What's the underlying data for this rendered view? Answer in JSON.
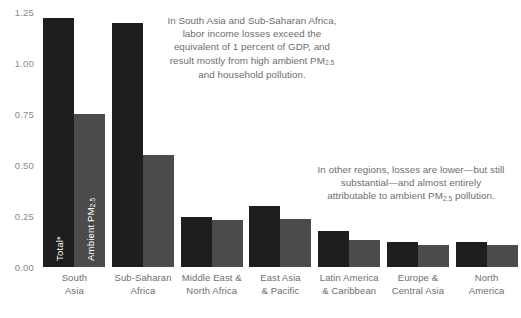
{
  "chart_data": {
    "type": "bar",
    "title": "",
    "subtitle": "",
    "xlabel": "",
    "ylabel": "",
    "ylim": [
      0.0,
      1.25
    ],
    "yticks": [
      "0.00",
      "0.25",
      "0.50",
      "0.75",
      "1.00",
      "1.25"
    ],
    "ytick_values": [
      0.0,
      0.25,
      0.5,
      0.75,
      1.0,
      1.25
    ],
    "grid": false,
    "legend_position": "in-bar",
    "categories": [
      "South Asia",
      "Sub-Saharan Africa",
      "Middle East & North Africa",
      "East Asia & Pacific",
      "Latin America & Caribbean",
      "Europe & Central Asia",
      "North America"
    ],
    "category_lines": [
      [
        "South",
        "Asia"
      ],
      [
        "Sub-Saharan",
        "Africa"
      ],
      [
        "Middle East &",
        "North Africa"
      ],
      [
        "East Asia",
        "& Pacific"
      ],
      [
        "Latin America",
        "& Caribbean"
      ],
      [
        "Europe &",
        "Central Asia"
      ],
      [
        "North",
        "America"
      ]
    ],
    "series": [
      {
        "name": "Total*",
        "label_html": "Total*",
        "color": "#1e1e1e",
        "values": [
          1.22,
          1.195,
          0.245,
          0.3,
          0.175,
          0.125,
          0.125
        ]
      },
      {
        "name": "Ambient PM2.5",
        "label_html": "Ambient PM<sub>2.5</sub>",
        "color": "#4b4b4b",
        "values": [
          0.75,
          0.55,
          0.23,
          0.235,
          0.13,
          0.11,
          0.11
        ]
      }
    ],
    "annotations": [
      {
        "id": "annotation-1",
        "html": "In South Asia and Sub-Saharan Africa, labor income losses exceed the equivalent of 1 percent of GDP, and result mostly from high ambient PM<sub>2.5</sub> and household pollution.",
        "text": "In South Asia and Sub-Saharan Africa, labor income losses exceed the equivalent of 1 percent of GDP, and result mostly from high ambient PM2.5 and household pollution."
      },
      {
        "id": "annotation-2",
        "html": "In other regions, losses are lower—but still substantial—and almost entirely attributable to ambient PM<sub>2.5</sub> pollution.",
        "text": "In other regions, losses are lower—but still substantial—and almost entirely attributable to ambient PM2.5 pollution."
      }
    ],
    "colors": {
      "total_bar": "#1e1e1e",
      "ambient_bar": "#4b4b4b",
      "axis_text": "#8a8a8a",
      "category_text": "#6e6e6e",
      "annotation_text": "#6e6e6e",
      "background": "#ffffff",
      "in_bar_label": "#ffffff"
    }
  }
}
